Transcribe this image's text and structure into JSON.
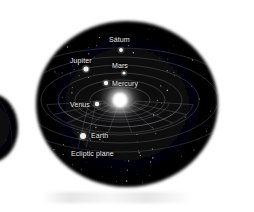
{
  "figure": {
    "title_visible": false,
    "background_color": "#ffffff",
    "space_color": "#050505",
    "orbit_color": "#9a9aa5",
    "label_color": "#e8e8e8",
    "sun_color": "#ffffff",
    "planet_color": "#f2f2f2"
  },
  "chart_data": {
    "type": "diagram",
    "title": "",
    "xlabel": "",
    "ylabel": "",
    "grid": true,
    "legend_position": "none",
    "sun": {
      "label": "",
      "cx": 120,
      "cy": 100,
      "glow_radius": 26,
      "core_radius": 7
    },
    "bodies": [
      {
        "name": "Saturn",
        "label": "Satum",
        "label_x": 109,
        "label_y": 36,
        "dot_x": 121,
        "dot_y": 50,
        "dot_r": 1.9,
        "orbit_index": 5
      },
      {
        "name": "Jupiter",
        "label": "Jupiter",
        "label_x": 70,
        "label_y": 57,
        "dot_x": 86,
        "dot_y": 69,
        "dot_r": 2.6,
        "orbit_index": 4
      },
      {
        "name": "Mars",
        "label": "Mars",
        "label_x": 112,
        "label_y": 62,
        "dot_x": 124,
        "dot_y": 73,
        "dot_r": 1.6,
        "orbit_index": 3
      },
      {
        "name": "Mercury",
        "label": "Mercury",
        "label_x": 112,
        "label_y": 80,
        "dot_x": 106,
        "dot_y": 83,
        "dot_r": 2.2,
        "orbit_index": 0
      },
      {
        "name": "Venus",
        "label": "Venus",
        "label_x": 70,
        "label_y": 101,
        "dot_x": 97,
        "dot_y": 104,
        "dot_r": 2.2,
        "orbit_index": 1
      },
      {
        "name": "Earth",
        "label": "Earth",
        "label_x": 91,
        "label_y": 132,
        "dot_x": 83,
        "dot_y": 136,
        "dot_r": 3.0,
        "orbit_index": 2
      }
    ],
    "annotations": [
      {
        "name": "ecliptic-plane",
        "label": "Ecliptic plane",
        "label_x": 71,
        "label_y": 150
      }
    ],
    "orbits": [
      {
        "index": 0,
        "rx": 30,
        "ry": 13
      },
      {
        "index": 1,
        "rx": 45,
        "ry": 20
      },
      {
        "index": 2,
        "rx": 62,
        "ry": 27
      },
      {
        "index": 3,
        "rx": 79,
        "ry": 35
      },
      {
        "index": 4,
        "rx": 98,
        "ry": 43
      },
      {
        "index": 5,
        "rx": 118,
        "ry": 52
      }
    ],
    "star_count": 120
  }
}
